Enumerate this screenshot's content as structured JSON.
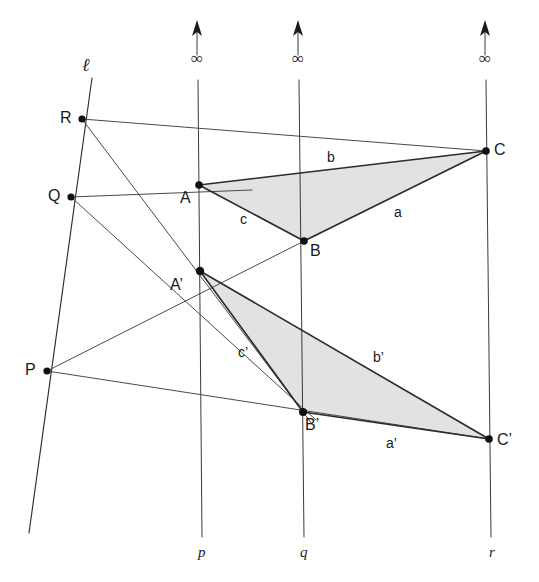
{
  "figure": {
    "canvas": {
      "width": 539,
      "height": 582
    },
    "colors": {
      "background": "#ffffff",
      "line": "#3a3a3a",
      "triangle_edge": "#2b2b2b",
      "triangle_fill": "#e2e2e2",
      "vertex": "#111111",
      "text": "#1a1a1a"
    }
  },
  "points": [
    {
      "id": "R",
      "label": "R",
      "x": 82,
      "y": 119,
      "label_x": 60,
      "label_y": 110
    },
    {
      "id": "Q",
      "label": "Q",
      "x": 71,
      "y": 197,
      "label_x": 48,
      "label_y": 188
    },
    {
      "id": "P",
      "label": "P",
      "x": 47,
      "y": 371,
      "label_x": 25,
      "label_y": 362
    },
    {
      "id": "A",
      "label": "A",
      "x": 199,
      "y": 185,
      "label_x": 180,
      "label_y": 190
    },
    {
      "id": "B",
      "label": "B",
      "x": 304,
      "y": 241,
      "label_x": 310,
      "label_y": 243
    },
    {
      "id": "C",
      "label": "C",
      "x": 486,
      "y": 151,
      "label_x": 494,
      "label_y": 142
    },
    {
      "id": "A2",
      "label": "A’",
      "x": 200,
      "y": 271,
      "label_x": 170,
      "label_y": 277
    },
    {
      "id": "B2",
      "label": "B’",
      "x": 303,
      "y": 412,
      "label_x": 305,
      "label_y": 417
    },
    {
      "id": "C2",
      "label": "C’",
      "x": 489,
      "y": 439,
      "label_x": 497,
      "label_y": 432
    }
  ],
  "vertical_lines": [
    {
      "id": "p",
      "label": "p",
      "infinity_symbol": "∞",
      "top_x": 197,
      "bottom_x": 202,
      "arrow_tip_y": 22,
      "gap_top_y": 55,
      "gap_bottom_y": 80,
      "bottom_y": 537,
      "inf_label_x": 191,
      "inf_label_y": 57,
      "name_label_x": 197,
      "name_label_y": 545
    },
    {
      "id": "q",
      "label": "q",
      "infinity_symbol": "∞",
      "top_x": 298,
      "bottom_x": 304,
      "arrow_tip_y": 22,
      "gap_top_y": 55,
      "gap_bottom_y": 80,
      "bottom_y": 537,
      "inf_label_x": 292,
      "inf_label_y": 57,
      "name_label_x": 299,
      "name_label_y": 545
    },
    {
      "id": "r",
      "label": "r",
      "infinity_symbol": "∞",
      "top_x": 485,
      "bottom_x": 491,
      "arrow_tip_y": 22,
      "gap_top_y": 55,
      "gap_bottom_y": 80,
      "bottom_y": 537,
      "inf_label_x": 479,
      "inf_label_y": 57,
      "name_label_x": 489,
      "name_label_y": 545
    }
  ],
  "axis_line": {
    "id": "ell",
    "label": "ℓ",
    "x1": 92,
    "y1": 78,
    "x2": 29,
    "y2": 533,
    "label_x": 82,
    "label_y": 57
  },
  "triangles": [
    {
      "id": "ABC",
      "vertices": [
        "A",
        "B",
        "C"
      ],
      "fill": "#e2e2e2",
      "sides": [
        {
          "id": "a",
          "label": "a",
          "from": "B",
          "to": "C",
          "label_x": 394,
          "label_y": 205
        },
        {
          "id": "b",
          "label": "b",
          "from": "C",
          "to": "A",
          "label_x": 327,
          "label_y": 150
        },
        {
          "id": "c",
          "label": "c",
          "from": "A",
          "to": "B",
          "label_x": 240,
          "label_y": 212
        }
      ]
    },
    {
      "id": "A2B2C2",
      "vertices": [
        "A2",
        "B2",
        "C2"
      ],
      "fill": "#e2e2e2",
      "sides": [
        {
          "id": "a2",
          "label": "a’",
          "from": "B2",
          "to": "C2",
          "label_x": 386,
          "label_y": 436
        },
        {
          "id": "b2",
          "label": "b’",
          "from": "C2",
          "to": "A2",
          "label_x": 373,
          "label_y": 350
        },
        {
          "id": "c2",
          "label": "c’",
          "from": "A2",
          "to": "B2",
          "label_x": 238,
          "label_y": 345
        }
      ]
    }
  ],
  "pencil_lines": [
    {
      "id": "R-A-C",
      "through": [
        "R",
        "A",
        "C"
      ],
      "x1": 82,
      "y1": 119,
      "x2": 486,
      "y2": 151
    },
    {
      "id": "R-B2",
      "through": [
        "R",
        "B2"
      ],
      "x1": 82,
      "y1": 119,
      "x2": 312,
      "y2": 424
    },
    {
      "id": "Q-A-A2",
      "through": [
        "Q",
        "A"
      ],
      "x1": 71,
      "y1": 197,
      "x2": 250,
      "y2": 190
    },
    {
      "id": "Q-B",
      "through": [
        "Q",
        "B"
      ],
      "x1": 71,
      "y1": 197,
      "x2": 315,
      "y2": 419
    },
    {
      "id": "P-A2",
      "through": [
        "P",
        "A2"
      ],
      "x1": 47,
      "y1": 371,
      "x2": 320,
      "y2": 233
    },
    {
      "id": "P-B2-C2",
      "through": [
        "P",
        "B2",
        "C2"
      ],
      "x1": 47,
      "y1": 371,
      "x2": 489,
      "y2": 439
    }
  ]
}
